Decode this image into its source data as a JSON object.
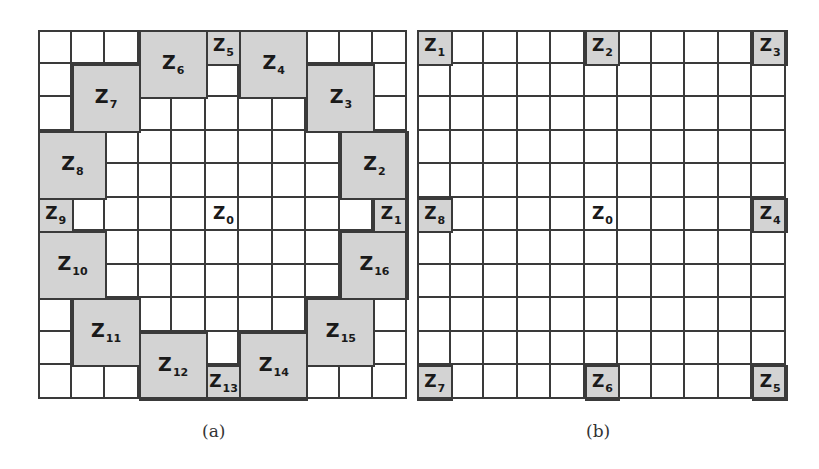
{
  "colors": {
    "zone_fill": "#d3d3d3",
    "grid_line": "#3a3a3a",
    "background": "#ffffff"
  },
  "grid_size": 11,
  "panels": [
    {
      "id": "a",
      "caption": "(a)",
      "zones": [
        {
          "label": "Z",
          "sub": "6",
          "col": 3,
          "row": 0,
          "w": 2,
          "h": 2
        },
        {
          "label": "Z",
          "sub": "5",
          "col": 5,
          "row": 0,
          "w": 1,
          "h": 1
        },
        {
          "label": "Z",
          "sub": "4",
          "col": 6,
          "row": 0,
          "w": 2,
          "h": 2
        },
        {
          "label": "Z",
          "sub": "7",
          "col": 1,
          "row": 1,
          "w": 2,
          "h": 2
        },
        {
          "label": "Z",
          "sub": "3",
          "col": 8,
          "row": 1,
          "w": 2,
          "h": 2
        },
        {
          "label": "Z",
          "sub": "8",
          "col": 0,
          "row": 3,
          "w": 2,
          "h": 2
        },
        {
          "label": "Z",
          "sub": "2",
          "col": 9,
          "row": 3,
          "w": 2,
          "h": 2
        },
        {
          "label": "Z",
          "sub": "9",
          "col": 0,
          "row": 5,
          "w": 1,
          "h": 1
        },
        {
          "label": "Z",
          "sub": "0",
          "col": 5,
          "row": 5,
          "w": 1,
          "h": 1,
          "white": true
        },
        {
          "label": "Z",
          "sub": "1",
          "col": 10,
          "row": 5,
          "w": 1,
          "h": 1
        },
        {
          "label": "Z",
          "sub": "10",
          "col": 0,
          "row": 6,
          "w": 2,
          "h": 2
        },
        {
          "label": "Z",
          "sub": "16",
          "col": 9,
          "row": 6,
          "w": 2,
          "h": 2
        },
        {
          "label": "Z",
          "sub": "11",
          "col": 1,
          "row": 8,
          "w": 2,
          "h": 2
        },
        {
          "label": "Z",
          "sub": "15",
          "col": 8,
          "row": 8,
          "w": 2,
          "h": 2
        },
        {
          "label": "Z",
          "sub": "12",
          "col": 3,
          "row": 9,
          "w": 2,
          "h": 2
        },
        {
          "label": "Z",
          "sub": "13",
          "col": 5,
          "row": 10,
          "w": 1,
          "h": 1
        },
        {
          "label": "Z",
          "sub": "14",
          "col": 6,
          "row": 9,
          "w": 2,
          "h": 2
        }
      ]
    },
    {
      "id": "b",
      "caption": "(b)",
      "zones": [
        {
          "label": "Z",
          "sub": "1",
          "col": 0,
          "row": 0,
          "w": 1,
          "h": 1
        },
        {
          "label": "Z",
          "sub": "2",
          "col": 5,
          "row": 0,
          "w": 1,
          "h": 1
        },
        {
          "label": "Z",
          "sub": "3",
          "col": 10,
          "row": 0,
          "w": 1,
          "h": 1
        },
        {
          "label": "Z",
          "sub": "8",
          "col": 0,
          "row": 5,
          "w": 1,
          "h": 1
        },
        {
          "label": "Z",
          "sub": "0",
          "col": 5,
          "row": 5,
          "w": 1,
          "h": 1,
          "white": true
        },
        {
          "label": "Z",
          "sub": "4",
          "col": 10,
          "row": 5,
          "w": 1,
          "h": 1
        },
        {
          "label": "Z",
          "sub": "7",
          "col": 0,
          "row": 10,
          "w": 1,
          "h": 1
        },
        {
          "label": "Z",
          "sub": "6",
          "col": 5,
          "row": 10,
          "w": 1,
          "h": 1
        },
        {
          "label": "Z",
          "sub": "5",
          "col": 10,
          "row": 10,
          "w": 1,
          "h": 1
        }
      ]
    }
  ]
}
